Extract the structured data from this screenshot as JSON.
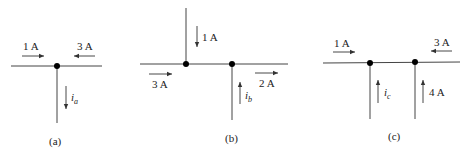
{
  "figure": {
    "panels": [
      {
        "caption": "(a)",
        "currents": [
          {
            "label": "1 A",
            "direction": "right"
          },
          {
            "label": "3 A",
            "direction": "left"
          },
          {
            "label": "i",
            "subscript": "a",
            "direction": "down"
          }
        ]
      },
      {
        "caption": "(b)",
        "currents": [
          {
            "label": "1 A",
            "direction": "down"
          },
          {
            "label": "3 A",
            "direction": "right"
          },
          {
            "label": "2 A",
            "direction": "right"
          },
          {
            "label": "i",
            "subscript": "b",
            "direction": "up"
          }
        ]
      },
      {
        "caption": "(c)",
        "currents": [
          {
            "label": "1 A",
            "direction": "right"
          },
          {
            "label": "3 A",
            "direction": "left"
          },
          {
            "label": "i",
            "subscript": "c",
            "direction": "up"
          },
          {
            "label": "4 A",
            "direction": "up"
          }
        ]
      }
    ]
  }
}
